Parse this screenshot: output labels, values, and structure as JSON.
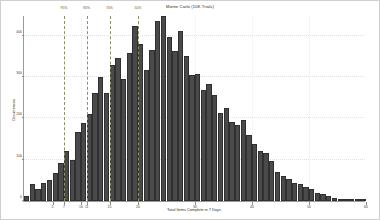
{
  "chart_data": {
    "type": "bar",
    "title": "Monte Carlo (10K Trials)",
    "xlabel": "Total Items Complete in 7 Days",
    "ylabel": "Occurrences",
    "xlim": [
      0,
      60
    ],
    "ylim": [
      0,
      450
    ],
    "grid": true,
    "legend": null,
    "bar_color": "#4a4a4a",
    "bar_edge_color": "#303030",
    "annotation_color": "#8f8f6a",
    "xticks": [
      5,
      7,
      10,
      11,
      15,
      20,
      30,
      40,
      50,
      60
    ],
    "xticklabels": [
      "5",
      "7",
      "10",
      "11",
      "15",
      "20",
      "30",
      "40",
      "50",
      "60"
    ],
    "yticks": [
      0,
      100,
      200,
      300,
      400
    ],
    "yticklabels": [
      "0",
      "100",
      "200",
      "300",
      "400"
    ],
    "annotations": [
      {
        "label": "95%",
        "x": 7,
        "style": "dashed-vline"
      },
      {
        "label": "85%",
        "x": 11,
        "style": "dashed-vline"
      },
      {
        "label": "70%",
        "x": 15,
        "style": "dashed-vline"
      },
      {
        "label": "50%",
        "x": 20,
        "style": "dashed-vline"
      }
    ],
    "categories": [
      1,
      2,
      3,
      4,
      5,
      6,
      7,
      8,
      9,
      10,
      11,
      12,
      13,
      14,
      15,
      16,
      17,
      18,
      19,
      20,
      21,
      22,
      23,
      24,
      25,
      26,
      27,
      28,
      29,
      30,
      31,
      32,
      33,
      34,
      35,
      36,
      37,
      38,
      39,
      40,
      41,
      42,
      43,
      44,
      45,
      46,
      47,
      48,
      49,
      50,
      51,
      52,
      53,
      54,
      55,
      56,
      57,
      58,
      59,
      60
    ],
    "values": [
      12,
      40,
      28,
      44,
      52,
      68,
      92,
      120,
      100,
      168,
      188,
      210,
      262,
      300,
      262,
      330,
      346,
      296,
      358,
      424,
      380,
      316,
      366,
      436,
      448,
      398,
      362,
      412,
      350,
      306,
      308,
      268,
      284,
      256,
      212,
      226,
      192,
      184,
      196,
      160,
      138,
      122,
      116,
      96,
      70,
      60,
      54,
      44,
      40,
      34,
      28,
      20,
      16,
      12,
      8,
      6,
      4,
      3,
      2,
      1
    ]
  }
}
